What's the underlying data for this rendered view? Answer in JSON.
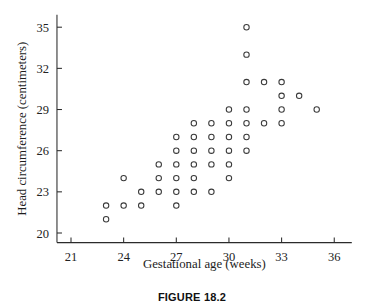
{
  "figure": {
    "caption": "FIGURE 18.2"
  },
  "chart_data": {
    "type": "scatter",
    "title": "",
    "xlabel": "Gestational age (weeks)",
    "ylabel": "Head circumference (centimeters)",
    "xlim": [
      20.2,
      37.0
    ],
    "ylim": [
      19.3,
      35.9
    ],
    "xticks": [
      21,
      24,
      27,
      30,
      33,
      36
    ],
    "yticks": [
      20,
      23,
      26,
      29,
      32,
      35
    ],
    "xtick_labels": [
      "21",
      "24",
      "27",
      "30",
      "33",
      "36"
    ],
    "ytick_labels": [
      "20",
      "23",
      "26",
      "29",
      "32",
      "35"
    ],
    "grid": false,
    "legend": "none",
    "marker": "open-circle",
    "marker_color": "#3a3a3a",
    "points": [
      {
        "x": 23,
        "y": 21
      },
      {
        "x": 23,
        "y": 22
      },
      {
        "x": 24,
        "y": 22
      },
      {
        "x": 25,
        "y": 22
      },
      {
        "x": 27,
        "y": 22
      },
      {
        "x": 24,
        "y": 24
      },
      {
        "x": 25,
        "y": 23
      },
      {
        "x": 26,
        "y": 23
      },
      {
        "x": 26,
        "y": 24
      },
      {
        "x": 26,
        "y": 25
      },
      {
        "x": 27,
        "y": 23
      },
      {
        "x": 27,
        "y": 24
      },
      {
        "x": 27,
        "y": 25
      },
      {
        "x": 27,
        "y": 26
      },
      {
        "x": 27,
        "y": 27
      },
      {
        "x": 28,
        "y": 23
      },
      {
        "x": 28,
        "y": 24
      },
      {
        "x": 28,
        "y": 25
      },
      {
        "x": 28,
        "y": 26
      },
      {
        "x": 28,
        "y": 27
      },
      {
        "x": 28,
        "y": 28
      },
      {
        "x": 29,
        "y": 23
      },
      {
        "x": 29,
        "y": 25
      },
      {
        "x": 29,
        "y": 26
      },
      {
        "x": 29,
        "y": 27
      },
      {
        "x": 29,
        "y": 28
      },
      {
        "x": 30,
        "y": 24
      },
      {
        "x": 30,
        "y": 25
      },
      {
        "x": 30,
        "y": 26
      },
      {
        "x": 30,
        "y": 27
      },
      {
        "x": 30,
        "y": 28
      },
      {
        "x": 30,
        "y": 29
      },
      {
        "x": 31,
        "y": 26
      },
      {
        "x": 31,
        "y": 27
      },
      {
        "x": 31,
        "y": 28
      },
      {
        "x": 31,
        "y": 29
      },
      {
        "x": 31,
        "y": 31
      },
      {
        "x": 31,
        "y": 33
      },
      {
        "x": 31,
        "y": 35
      },
      {
        "x": 32,
        "y": 28
      },
      {
        "x": 32,
        "y": 31
      },
      {
        "x": 33,
        "y": 28
      },
      {
        "x": 33,
        "y": 29
      },
      {
        "x": 33,
        "y": 30
      },
      {
        "x": 33,
        "y": 31
      },
      {
        "x": 34,
        "y": 30
      },
      {
        "x": 35,
        "y": 29
      }
    ]
  }
}
